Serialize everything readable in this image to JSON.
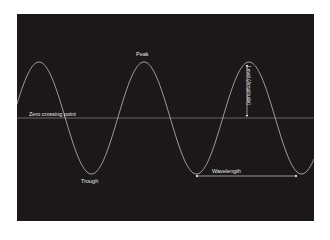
{
  "diagram": {
    "colors": {
      "background": "#1c1819",
      "page": "#ffffff",
      "wave": "#bdbdbd",
      "zero_line": "#9a9a9a",
      "label": "#e8e8e8"
    },
    "labels": {
      "peak": "Peak",
      "trough": "Trough",
      "zero_crossing": "Zero crossing point",
      "amplitude": "Level (Amplitude)",
      "wavelength": "Wavelength"
    },
    "wave": {
      "baseline_y": 118,
      "amplitude_px": 56,
      "period_px": 105,
      "peaks_x": [
        39,
        141,
        247
      ],
      "troughs_x": [
        90,
        197,
        296
      ]
    }
  }
}
